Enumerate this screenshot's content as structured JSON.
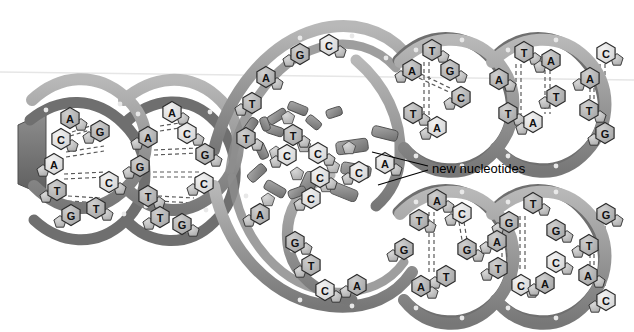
{
  "figure": {
    "background_color": "#ffffff",
    "ribbon_color": "#9a9a9a",
    "ribbon_dark_color": "#6f6f6f",
    "ribbon_light_color": "#c9c9c9",
    "base_fill_light": "#e2e2e2",
    "base_fill_mid": "#b9b9b9",
    "base_fill_dark": "#8e8e8e",
    "base_stroke": "#2c2c2c",
    "hbond_color": "#4a4a4a",
    "line_color": "#000000"
  },
  "annotations": [
    {
      "id": "new-nucleotides",
      "label": "new nucleotides",
      "x": 432,
      "y": 168,
      "leaders": [
        {
          "from_x": 428,
          "from_y": 166,
          "to_x": 372,
          "to_y": 152
        },
        {
          "from_x": 428,
          "from_y": 170,
          "to_x": 378,
          "to_y": 185
        }
      ]
    }
  ],
  "strands": {
    "parent_left": {
      "name": "parent double helix (unreplicated)",
      "turns": 2,
      "base_pairs": [
        {
          "top": "A",
          "bottom": "G"
        },
        {
          "top": "C",
          "bottom": "G"
        },
        {
          "top": "A",
          "bottom": "C"
        },
        {
          "top": "T",
          "bottom": "T"
        },
        {
          "top": "G",
          "bottom": "C"
        },
        {
          "top": "A",
          "bottom": "A"
        },
        {
          "top": "A",
          "bottom": "C"
        },
        {
          "top": "G",
          "bottom": "G"
        },
        {
          "top": "T",
          "bottom": "C"
        },
        {
          "top": "T",
          "bottom": "G"
        }
      ]
    },
    "template_upper": {
      "name": "upper separated template strand",
      "bases": [
        "C",
        "G",
        "A",
        "T",
        "T"
      ]
    },
    "template_lower": {
      "name": "lower separated template strand",
      "bases": [
        "C",
        "A",
        "G",
        "T",
        "C",
        "A"
      ]
    },
    "daughter_upper": {
      "name": "upper newly synthesized double helix",
      "base_pairs": [
        {
          "top": "T",
          "bottom": "A"
        },
        {
          "top": "A",
          "bottom": "T"
        },
        {
          "top": "G",
          "bottom": "C"
        },
        {
          "top": "T",
          "bottom": "A"
        },
        {
          "top": "A",
          "bottom": "T"
        },
        {
          "top": "A",
          "bottom": "T"
        },
        {
          "top": "C",
          "bottom": "G"
        },
        {
          "top": "A",
          "bottom": "T"
        }
      ]
    },
    "daughter_lower": {
      "name": "lower newly synthesized double helix",
      "base_pairs": [
        {
          "top": "A",
          "bottom": "T"
        },
        {
          "top": "T",
          "bottom": "A"
        },
        {
          "top": "C",
          "bottom": "G"
        },
        {
          "top": "G",
          "bottom": "C"
        },
        {
          "top": "T",
          "bottom": "A"
        },
        {
          "top": "G",
          "bottom": "C"
        },
        {
          "top": "A",
          "bottom": "C"
        },
        {
          "top": "G",
          "bottom": "C"
        }
      ]
    },
    "free_nucleotides": {
      "name": "free floating nucleotides in replication bubble",
      "bases": [
        "T",
        "C",
        "C",
        "C",
        "A",
        "C"
      ]
    }
  },
  "base_positions": {
    "parent_left_helix1": [
      {
        "letter": "A",
        "x": 70,
        "y": 118,
        "tone": "mid"
      },
      {
        "letter": "G",
        "x": 100,
        "y": 131,
        "tone": "mid"
      },
      {
        "letter": "C",
        "x": 61,
        "y": 139,
        "tone": "light"
      },
      {
        "letter": "A",
        "x": 54,
        "y": 164,
        "tone": "light"
      },
      {
        "letter": "C",
        "x": 109,
        "y": 182,
        "tone": "light"
      },
      {
        "letter": "T",
        "x": 57,
        "y": 190,
        "tone": "mid"
      },
      {
        "letter": "T",
        "x": 96,
        "y": 208,
        "tone": "mid"
      },
      {
        "letter": "G",
        "x": 71,
        "y": 215,
        "tone": "mid"
      }
    ],
    "parent_left_helix2": [
      {
        "letter": "A",
        "x": 172,
        "y": 112,
        "tone": "light"
      },
      {
        "letter": "A",
        "x": 148,
        "y": 137,
        "tone": "mid"
      },
      {
        "letter": "C",
        "x": 187,
        "y": 133,
        "tone": "light"
      },
      {
        "letter": "G",
        "x": 140,
        "y": 166,
        "tone": "mid"
      },
      {
        "letter": "G",
        "x": 205,
        "y": 154,
        "tone": "mid"
      },
      {
        "letter": "C",
        "x": 204,
        "y": 183,
        "tone": "light"
      },
      {
        "letter": "T",
        "x": 148,
        "y": 196,
        "tone": "mid"
      },
      {
        "letter": "T",
        "x": 160,
        "y": 217,
        "tone": "mid"
      },
      {
        "letter": "G",
        "x": 182,
        "y": 224,
        "tone": "mid"
      }
    ],
    "template_upper": [
      {
        "letter": "C",
        "x": 329,
        "y": 45,
        "tone": "light"
      },
      {
        "letter": "G",
        "x": 300,
        "y": 54,
        "tone": "mid"
      },
      {
        "letter": "A",
        "x": 266,
        "y": 77,
        "tone": "mid"
      },
      {
        "letter": "T",
        "x": 252,
        "y": 103,
        "tone": "mid"
      },
      {
        "letter": "T",
        "x": 246,
        "y": 138,
        "tone": "mid"
      }
    ],
    "template_lower": [
      {
        "letter": "C",
        "x": 320,
        "y": 177,
        "tone": "light"
      },
      {
        "letter": "A",
        "x": 260,
        "y": 214,
        "tone": "mid"
      },
      {
        "letter": "G",
        "x": 295,
        "y": 242,
        "tone": "mid"
      },
      {
        "letter": "T",
        "x": 311,
        "y": 265,
        "tone": "mid"
      },
      {
        "letter": "C",
        "x": 325,
        "y": 290,
        "tone": "light"
      },
      {
        "letter": "A",
        "x": 357,
        "y": 285,
        "tone": "mid"
      }
    ],
    "free_nucleotides": [
      {
        "letter": "T",
        "x": 293,
        "y": 135,
        "tone": "mid"
      },
      {
        "letter": "C",
        "x": 287,
        "y": 155,
        "tone": "light"
      },
      {
        "letter": "C",
        "x": 318,
        "y": 153,
        "tone": "light"
      },
      {
        "letter": "C",
        "x": 359,
        "y": 172,
        "tone": "light"
      },
      {
        "letter": "A",
        "x": 385,
        "y": 163,
        "tone": "light"
      },
      {
        "letter": "C",
        "x": 311,
        "y": 198,
        "tone": "light"
      }
    ],
    "daughter_upper_h1": [
      {
        "letter": "T",
        "x": 432,
        "y": 50,
        "tone": "mid"
      },
      {
        "letter": "A",
        "x": 412,
        "y": 70,
        "tone": "mid"
      },
      {
        "letter": "G",
        "x": 450,
        "y": 70,
        "tone": "mid"
      },
      {
        "letter": "C",
        "x": 461,
        "y": 97,
        "tone": "mid"
      },
      {
        "letter": "T",
        "x": 413,
        "y": 113,
        "tone": "mid"
      },
      {
        "letter": "A",
        "x": 437,
        "y": 127,
        "tone": "light"
      }
    ],
    "daughter_upper_h2": [
      {
        "letter": "T",
        "x": 524,
        "y": 52,
        "tone": "mid"
      },
      {
        "letter": "A",
        "x": 551,
        "y": 60,
        "tone": "mid"
      },
      {
        "letter": "A",
        "x": 499,
        "y": 79,
        "tone": "mid"
      },
      {
        "letter": "T",
        "x": 556,
        "y": 96,
        "tone": "mid"
      },
      {
        "letter": "T",
        "x": 508,
        "y": 113,
        "tone": "mid"
      },
      {
        "letter": "A",
        "x": 533,
        "y": 122,
        "tone": "light"
      }
    ],
    "daughter_upper_h3": [
      {
        "letter": "C",
        "x": 606,
        "y": 53,
        "tone": "light"
      },
      {
        "letter": "A",
        "x": 590,
        "y": 78,
        "tone": "mid"
      },
      {
        "letter": "T",
        "x": 589,
        "y": 110,
        "tone": "mid"
      },
      {
        "letter": "G",
        "x": 605,
        "y": 133,
        "tone": "mid"
      }
    ],
    "daughter_lower_h1": [
      {
        "letter": "A",
        "x": 437,
        "y": 200,
        "tone": "mid"
      },
      {
        "letter": "C",
        "x": 462,
        "y": 213,
        "tone": "light"
      },
      {
        "letter": "T",
        "x": 419,
        "y": 220,
        "tone": "mid"
      },
      {
        "letter": "G",
        "x": 404,
        "y": 249,
        "tone": "mid"
      },
      {
        "letter": "G",
        "x": 467,
        "y": 249,
        "tone": "mid"
      },
      {
        "letter": "T",
        "x": 446,
        "y": 276,
        "tone": "mid"
      },
      {
        "letter": "A",
        "x": 421,
        "y": 286,
        "tone": "mid"
      }
    ],
    "daughter_lower_h2": [
      {
        "letter": "T",
        "x": 533,
        "y": 203,
        "tone": "mid"
      },
      {
        "letter": "G",
        "x": 509,
        "y": 222,
        "tone": "mid"
      },
      {
        "letter": "G",
        "x": 556,
        "y": 230,
        "tone": "mid"
      },
      {
        "letter": "A",
        "x": 497,
        "y": 241,
        "tone": "mid"
      },
      {
        "letter": "C",
        "x": 556,
        "y": 262,
        "tone": "light"
      },
      {
        "letter": "T",
        "x": 498,
        "y": 268,
        "tone": "mid"
      },
      {
        "letter": "C",
        "x": 521,
        "y": 285,
        "tone": "light"
      },
      {
        "letter": "A",
        "x": 545,
        "y": 283,
        "tone": "mid"
      }
    ],
    "daughter_lower_h3": [
      {
        "letter": "G",
        "x": 606,
        "y": 214,
        "tone": "mid"
      },
      {
        "letter": "T",
        "x": 589,
        "y": 245,
        "tone": "mid"
      },
      {
        "letter": "A",
        "x": 588,
        "y": 275,
        "tone": "mid"
      },
      {
        "letter": "C",
        "x": 606,
        "y": 300,
        "tone": "light"
      }
    ]
  }
}
